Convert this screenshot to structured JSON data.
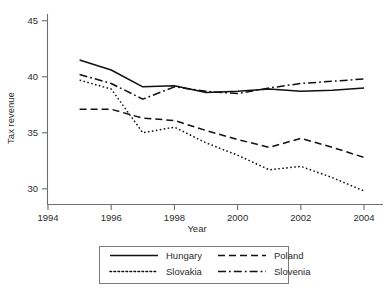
{
  "chart_data": {
    "type": "line",
    "title": "",
    "xlabel": "Year",
    "ylabel": "Tax revenue",
    "x": [
      1995,
      1996,
      1997,
      1998,
      1999,
      2000,
      2001,
      2002,
      2003,
      2004
    ],
    "xlim": [
      1994,
      2004.6
    ],
    "ylim": [
      28.6,
      45.6
    ],
    "xticks": [
      1994,
      1996,
      1998,
      2000,
      2002,
      2004
    ],
    "xticklabels": [
      "1994",
      "1996",
      "1998",
      "2000",
      "2002",
      "2004"
    ],
    "yticks": [
      30,
      35,
      40,
      45
    ],
    "yticklabels": [
      "30",
      "35",
      "40",
      "45"
    ],
    "grid": false,
    "legend_position": "below",
    "series": [
      {
        "name": "Hungary",
        "style": "solid",
        "values": [
          41.5,
          40.6,
          39.1,
          39.2,
          38.6,
          38.7,
          38.9,
          38.7,
          38.8,
          39.0
        ]
      },
      {
        "name": "Poland",
        "style": "dashed",
        "values": [
          37.1,
          37.1,
          36.3,
          36.1,
          35.2,
          34.4,
          33.7,
          34.5,
          33.7,
          32.8
        ]
      },
      {
        "name": "Slovakia",
        "style": "dotted",
        "values": [
          39.7,
          38.9,
          35.0,
          35.5,
          34.1,
          33.0,
          31.7,
          32.0,
          31.0,
          29.8
        ]
      },
      {
        "name": "Slovenia",
        "style": "dashdot",
        "values": [
          40.2,
          39.4,
          38.0,
          39.1,
          38.7,
          38.5,
          39.0,
          39.4,
          39.6,
          39.8
        ]
      }
    ]
  },
  "legend": {
    "entries": [
      {
        "label": "Hungary",
        "style": "solid"
      },
      {
        "label": "Poland",
        "style": "dashed"
      },
      {
        "label": "Slovakia",
        "style": "dotted"
      },
      {
        "label": "Slovenia",
        "style": "dashdot"
      }
    ]
  },
  "colors": {
    "line": "#111111",
    "axis": "#6e6e6e",
    "text": "#2b2b2b",
    "background": "#ffffff"
  }
}
